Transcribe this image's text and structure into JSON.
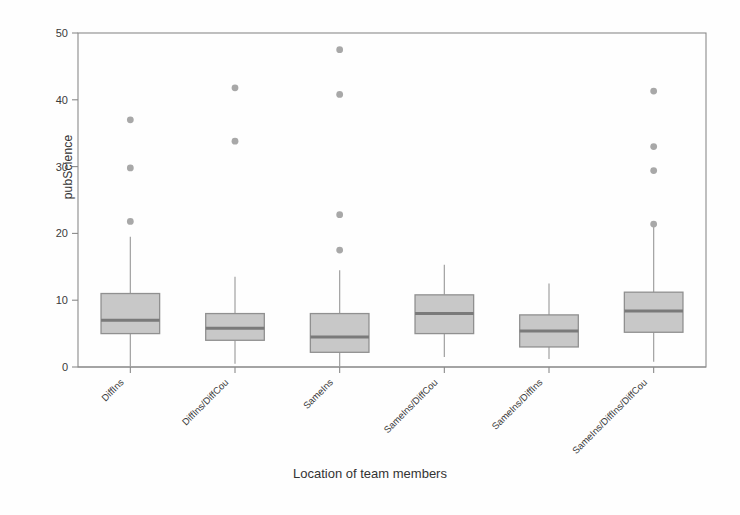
{
  "chart_data": {
    "type": "box",
    "title": "",
    "xlabel": "Location of team members",
    "ylabel": "pubScience",
    "ylim": [
      0,
      50
    ],
    "yticks": [
      0,
      10,
      20,
      30,
      40,
      50
    ],
    "ytick_labels": [
      "0",
      "10",
      "20",
      "30",
      "40",
      "50"
    ],
    "grid": false,
    "legend": "none",
    "categories": [
      "DiffIns",
      "DiffIns/DiffCou",
      "SameIns",
      "SameIns/DiffCou",
      "SameIns/DiffIns",
      "SameIns/DiffIns/DiffCou"
    ],
    "boxes": [
      {
        "category": "DiffIns",
        "whisker_low": 0.0,
        "q1": 5.0,
        "median": 7.0,
        "q3": 11.0,
        "whisker_high": 19.5,
        "outliers": [
          37.0,
          29.8,
          21.8
        ]
      },
      {
        "category": "DiffIns/DiffCou",
        "whisker_low": 0.5,
        "q1": 4.0,
        "median": 5.8,
        "q3": 8.0,
        "whisker_high": 13.5,
        "outliers": [
          41.8,
          33.8
        ]
      },
      {
        "category": "SameIns",
        "whisker_low": 0.0,
        "q1": 2.2,
        "median": 4.5,
        "q3": 8.0,
        "whisker_high": 14.5,
        "outliers": [
          47.5,
          40.8,
          22.8,
          17.5
        ]
      },
      {
        "category": "SameIns/DiffCou",
        "whisker_low": 1.5,
        "q1": 5.0,
        "median": 8.0,
        "q3": 10.8,
        "whisker_high": 15.3,
        "outliers": []
      },
      {
        "category": "SameIns/DiffIns",
        "whisker_low": 1.2,
        "q1": 3.0,
        "median": 5.4,
        "q3": 7.8,
        "whisker_high": 12.5,
        "outliers": []
      },
      {
        "category": "SameIns/DiffIns/DiffCou",
        "whisker_low": 0.8,
        "q1": 5.2,
        "median": 8.4,
        "q3": 11.2,
        "whisker_high": 21.0,
        "outliers": [
          41.3,
          33.0,
          29.4,
          21.4
        ]
      }
    ],
    "colors": {
      "box_fill": "#c8c8c8",
      "box_edge": "#909090",
      "median": "#7a7a7a",
      "whisker": "#a0a0a0",
      "outlier": "#a8a8a8",
      "axis": "#8a8a8a",
      "background": "#fefefe",
      "text": "#333333"
    }
  }
}
